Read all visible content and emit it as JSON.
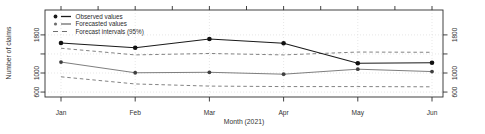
{
  "window": {
    "background": "#ffffff"
  },
  "chart_data": {
    "type": "line",
    "title": "",
    "xlabel": "Month (2021)",
    "ylabel": "Number of claims",
    "x_categories": [
      "Jan",
      "Feb",
      "Mar",
      "Apr",
      "May",
      "Jun"
    ],
    "y_ticks_all": [
      600,
      1000,
      1400,
      1800
    ],
    "y_ticks_labeled": [
      600,
      1000,
      1800
    ],
    "ylim": [
      500,
      2300
    ],
    "grid": true,
    "legend_position": "top-left",
    "legend": [
      {
        "label": "Observed values",
        "style": "solid-point",
        "color": "#1a1a1a"
      },
      {
        "label": "Forecasted values",
        "style": "solid-point",
        "color": "#6f6f6f"
      },
      {
        "label": "Forecast intervals (95%)",
        "style": "dashed",
        "color": "#6f6f6f"
      }
    ],
    "series": [
      {
        "name": "Observed values",
        "type": "line-points",
        "values": [
          1630,
          1530,
          1715,
          1625,
          1205,
          1215
        ]
      },
      {
        "name": "Forecasted values",
        "type": "line-points",
        "values": [
          1230,
          1005,
          1015,
          975,
          1080,
          1030
        ]
      },
      {
        "name": "Upper 95% forecast interval",
        "type": "dashed-line",
        "values": [
          1520,
          1380,
          1410,
          1380,
          1440,
          1435
        ]
      },
      {
        "name": "Lower 95% forecast interval",
        "type": "dashed-line",
        "values": [
          920,
          770,
          725,
          715,
          715,
          710
        ]
      }
    ],
    "colors": {
      "observed": "#1a1a1a",
      "observed_point": "#111111",
      "forecast": "#6f6f6f",
      "forecast_point": "#3f3f3f",
      "interval": "#757575",
      "grid": "#dcdcdc",
      "axis": "#2e2e2e",
      "text": "#333333"
    }
  }
}
